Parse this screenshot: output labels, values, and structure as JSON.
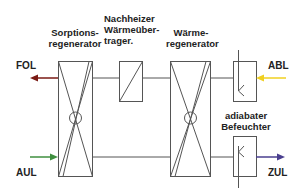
{
  "components": {
    "sorption": {
      "line1": "Sorptions-",
      "line2": "regenerator"
    },
    "reheater": {
      "line1": "Nachheizer",
      "line2": "Wärmeüber-",
      "line3": "trager."
    },
    "heat_regen": {
      "line1": "Wärme-",
      "line2": "regenerator"
    },
    "humidifier": {
      "line1": "adiabater",
      "line2": "Befeuchter"
    }
  },
  "streams": {
    "fol": {
      "label": "FOL",
      "color": "#7a1a14"
    },
    "abl": {
      "label": "ABL",
      "color": "#f0d020"
    },
    "aul": {
      "label": "AUL",
      "color": "#3f8f3f"
    },
    "zul": {
      "label": "ZUL",
      "color": "#4a3f8f"
    }
  },
  "line_color": "#555555"
}
